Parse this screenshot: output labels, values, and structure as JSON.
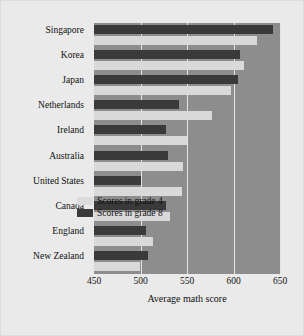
{
  "chart_data": {
    "type": "bar",
    "orientation": "horizontal",
    "title": "",
    "xlabel": "Average math score",
    "ylabel": "",
    "xlim": [
      450,
      650
    ],
    "xticks": [
      450,
      500,
      550,
      600,
      650
    ],
    "grid": true,
    "legend_position": "inside-lower-right",
    "categories": [
      "Singapore",
      "Korea",
      "Japan",
      "Netherlands",
      "Ireland",
      "Australia",
      "United States",
      "Canada",
      "England",
      "New Zealand"
    ],
    "series": [
      {
        "name": "Scores in grade 4",
        "color": "#d9d9d9",
        "values": [
          625,
          611,
          597,
          577,
          550,
          546,
          545,
          532,
          513,
          499
        ]
      },
      {
        "name": "Scores in grade 8",
        "color": "#3a3a3a",
        "values": [
          643,
          607,
          605,
          541,
          527,
          530,
          500,
          527,
          506,
          508
        ]
      }
    ],
    "plot_background": "#8d8d8d",
    "figure_background": "#eaeaea",
    "gridline_color": "#e4e4e4"
  },
  "legend": {
    "items": [
      {
        "label": "Scores in grade 4",
        "swatch": "g4"
      },
      {
        "label": "Scores in grade 8",
        "swatch": "g8"
      }
    ]
  }
}
